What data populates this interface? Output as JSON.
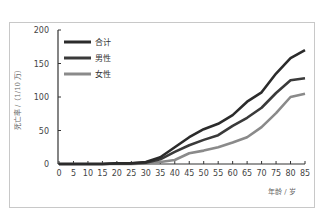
{
  "chart_data": {
    "type": "line",
    "title": "",
    "xlabel": "年龄 / 岁",
    "ylabel": "死亡率 /（1/10 万）",
    "x": [
      0,
      5,
      10,
      15,
      20,
      25,
      30,
      35,
      40,
      45,
      50,
      55,
      60,
      65,
      70,
      75,
      80,
      85
    ],
    "xlim": [
      0,
      85
    ],
    "ylim": [
      0,
      200
    ],
    "yticks": [
      0,
      50,
      100,
      150,
      200
    ],
    "xticks": [
      0,
      5,
      10,
      15,
      20,
      25,
      30,
      35,
      40,
      45,
      50,
      55,
      60,
      65,
      70,
      75,
      80,
      85
    ],
    "grid": false,
    "legend_position": "upper-left",
    "series": [
      {
        "name": "合计",
        "color": "#2b2b2b",
        "values": [
          0,
          0,
          0,
          0,
          1,
          1,
          3,
          10,
          25,
          40,
          52,
          60,
          73,
          93,
          107,
          135,
          158,
          170
        ]
      },
      {
        "name": "男性",
        "color": "#3a3a3a",
        "values": [
          0,
          0,
          0,
          0,
          1,
          1,
          2,
          7,
          18,
          28,
          36,
          43,
          57,
          69,
          84,
          106,
          125,
          128
        ]
      },
      {
        "name": "女性",
        "color": "#8a8a8a",
        "values": [
          0,
          0,
          0,
          0,
          0,
          0,
          1,
          3,
          6,
          16,
          20,
          25,
          32,
          40,
          55,
          76,
          100,
          105
        ]
      }
    ]
  }
}
